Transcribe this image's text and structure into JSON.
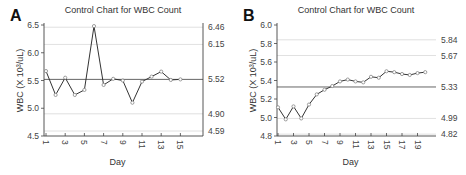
{
  "chart_data": [
    {
      "panel": "A",
      "type": "line",
      "title": "Control Chart for WBC Count",
      "xlabel": "Day",
      "ylabel": "WBC (X 10³/uL)",
      "ylim": [
        4.5,
        6.5
      ],
      "yticks": [
        "6.5",
        "6.0",
        "5.5",
        "5.0",
        "4.5"
      ],
      "xticks": [
        "1",
        "3",
        "5",
        "7",
        "9",
        "11",
        "13",
        "15"
      ],
      "right_labels": [
        "6.46",
        "6.15",
        "5.52",
        "4.90",
        "4.59"
      ],
      "control_lines": {
        "center": 5.52,
        "limits": [
          6.46,
          6.15,
          4.9,
          4.59
        ]
      },
      "x": [
        1,
        2,
        3,
        4,
        5,
        6,
        7,
        8,
        9,
        10,
        11,
        12,
        13,
        14,
        15
      ],
      "values": [
        5.67,
        5.24,
        5.55,
        5.24,
        5.33,
        6.48,
        5.42,
        5.53,
        5.5,
        5.1,
        5.48,
        5.57,
        5.66,
        5.51,
        5.52
      ],
      "grid": true
    },
    {
      "panel": "B",
      "type": "line",
      "title": "Control Chart for WBC Count",
      "xlabel": "Day",
      "ylabel": "WBC (X 10³/uL)",
      "ylim": [
        4.8,
        6.0
      ],
      "yticks": [
        "6.0",
        "5.8",
        "5.6",
        "5.4",
        "5.2",
        "5.0",
        "4.8"
      ],
      "xticks": [
        "1",
        "3",
        "5",
        "7",
        "9",
        "11",
        "13",
        "15",
        "17",
        "19"
      ],
      "right_labels": [
        "5.84",
        "5.67",
        "5.33",
        "4.99",
        "4.82"
      ],
      "control_lines": {
        "center": 5.33,
        "limits": [
          5.84,
          5.67,
          4.99,
          4.82
        ]
      },
      "x": [
        1,
        2,
        3,
        4,
        5,
        6,
        7,
        8,
        9,
        10,
        11,
        12,
        13,
        14,
        15,
        16,
        17,
        18,
        19,
        20
      ],
      "values": [
        5.11,
        4.98,
        5.12,
        4.99,
        5.14,
        5.25,
        5.3,
        5.34,
        5.39,
        5.41,
        5.39,
        5.38,
        5.44,
        5.43,
        5.5,
        5.49,
        5.47,
        5.46,
        5.48,
        5.49
      ],
      "grid": true
    }
  ]
}
